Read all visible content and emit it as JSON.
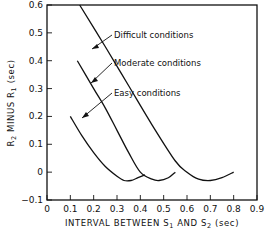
{
  "chart_data": {
    "type": "line",
    "title": "",
    "xlabel": "INTERVAL BETWEEN S1 AND S2 (sec)",
    "ylabel": "R2 MINUS R1 (sec)",
    "xlim": [
      0,
      0.9
    ],
    "ylim": [
      -0.1,
      0.6
    ],
    "xticks": [
      "0",
      "0.1",
      "0.2",
      "0.3",
      "0.4",
      "0.5",
      "0.6",
      "0.7",
      "0.8",
      "0.9"
    ],
    "yticks": [
      "0.6",
      "0.5",
      "0.4",
      "0.3",
      "0.2",
      "0.1",
      "0",
      "-0.1"
    ],
    "grid": false,
    "legend": "inline annotations with arrows",
    "series": [
      {
        "name": "Difficult conditions",
        "x": [
          0.14,
          0.25,
          0.35,
          0.45,
          0.55,
          0.6,
          0.65,
          0.7,
          0.75,
          0.8
        ],
        "y": [
          0.6,
          0.45,
          0.31,
          0.17,
          0.04,
          0.0,
          -0.025,
          -0.03,
          -0.02,
          0.0
        ]
      },
      {
        "name": "Moderate conditions",
        "x": [
          0.13,
          0.2,
          0.25,
          0.3,
          0.35,
          0.4,
          0.45,
          0.48,
          0.52,
          0.55
        ],
        "y": [
          0.4,
          0.3,
          0.23,
          0.15,
          0.07,
          0.0,
          -0.025,
          -0.03,
          -0.02,
          0.0
        ]
      },
      {
        "name": "Easy conditions",
        "x": [
          0.1,
          0.15,
          0.2,
          0.25,
          0.3,
          0.33,
          0.36,
          0.39,
          0.42
        ],
        "y": [
          0.2,
          0.13,
          0.07,
          0.02,
          -0.015,
          -0.03,
          -0.03,
          -0.02,
          -0.01
        ]
      }
    ],
    "annotations": [
      {
        "text": "Difficult conditions",
        "arrow_to": [
          0.3,
          0.39
        ]
      },
      {
        "text": "Moderate conditions",
        "arrow_to": [
          0.17,
          0.33
        ]
      },
      {
        "text": "Easy conditions",
        "arrow_to": [
          0.13,
          0.19
        ]
      }
    ]
  },
  "labels": {
    "xlabel_main": "INTERVAL BETWEEN S",
    "xlabel_sub1": "1",
    "xlabel_mid": " AND S",
    "xlabel_sub2": "2",
    "xlabel_unit": " (sec)",
    "ylabel_r2": "R",
    "ylabel_sub2": "2",
    "ylabel_minus": " MINUS R",
    "ylabel_sub1": "1",
    "ylabel_unit": "  (sec)",
    "ann_difficult": "Difficult conditions",
    "ann_moderate": "Moderate conditions",
    "ann_easy": "Easy conditions"
  }
}
